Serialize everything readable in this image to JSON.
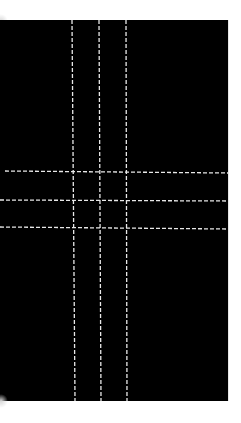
{
  "image": {
    "description": "Black rectangle with a grid of white dashed lines (3 vertical, 3 horizontal)",
    "background_color": "#000000",
    "line_color": "#e8e8e8",
    "frame": {
      "x": 0,
      "y": 20,
      "width": 228,
      "height": 381
    },
    "vertical_lines": [
      {
        "x_top": 72,
        "x_bottom": 75
      },
      {
        "x_top": 99,
        "x_bottom": 101
      },
      {
        "x_top": 126,
        "x_bottom": 127
      }
    ],
    "horizontal_lines": [
      {
        "x_start": 5,
        "y_left": 171,
        "y_right": 173
      },
      {
        "x_start": 0,
        "y_left": 200,
        "y_right": 201
      },
      {
        "x_start": 0,
        "y_left": 227,
        "y_right": 229
      }
    ]
  }
}
